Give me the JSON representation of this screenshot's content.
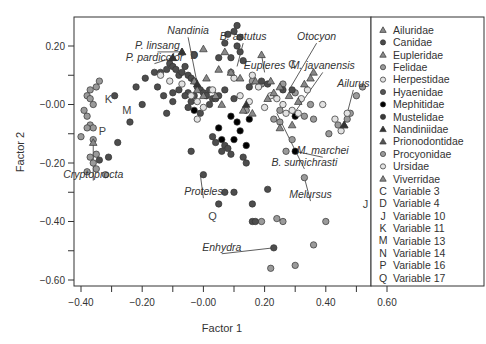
{
  "chart_data": {
    "type": "scatter",
    "title": "",
    "xlabel": "Factor 1",
    "ylabel": "Factor 2",
    "xlim": [
      -0.42,
      0.62
    ],
    "ylim": [
      -0.62,
      0.28
    ],
    "xticks": [
      -0.4,
      -0.3,
      -0.2,
      -0.1,
      0.0,
      0.1,
      0.2,
      0.3,
      0.4,
      0.5,
      0.6
    ],
    "xtick_labels": [
      "-0.40",
      "-0.20",
      "-0.00",
      "0.20",
      "0.40",
      "0.60"
    ],
    "yticks": [
      0.2,
      0.1,
      0.0,
      -0.1,
      -0.2,
      -0.3,
      -0.4,
      -0.5,
      -0.6
    ],
    "ytick_labels": [
      "0.20",
      "-0.00",
      "-0.20",
      "-0.40",
      "-0.60"
    ],
    "grid": false,
    "legend_position": "right",
    "legend": [
      {
        "label": "Ailuridae",
        "marker": "triangle",
        "color": "#8a8a8a"
      },
      {
        "label": "Canidae",
        "marker": "circle",
        "color": "#4a4a4a"
      },
      {
        "label": "Eupleridae",
        "marker": "triangle",
        "color": "#8a8a8a"
      },
      {
        "label": "Felidae",
        "marker": "circle",
        "color": "#9a9a9a"
      },
      {
        "label": "Herpestidae",
        "marker": "circle-open",
        "color": "#b8b8b8"
      },
      {
        "label": "Hyaenidae",
        "marker": "circle",
        "color": "#555555"
      },
      {
        "label": "Mephitidae",
        "marker": "circle",
        "color": "#000000"
      },
      {
        "label": "Mustelidae",
        "marker": "circle",
        "color": "#3a3a3a"
      },
      {
        "label": "Nandiniidae",
        "marker": "triangle",
        "color": "#333333"
      },
      {
        "label": "Prionodontidae",
        "marker": "triangle",
        "color": "#555555"
      },
      {
        "label": "Procyonidae",
        "marker": "circle",
        "color": "#9a9a9a"
      },
      {
        "label": "Ursidae",
        "marker": "circle-open",
        "color": "#b0b0b0"
      },
      {
        "label": "Viverridae",
        "marker": "triangle",
        "color": "#8a8a8a"
      },
      {
        "label": "Variable 3",
        "marker": "C"
      },
      {
        "label": "Variable 4",
        "marker": "D"
      },
      {
        "label": "Variable 10",
        "marker": "J"
      },
      {
        "label": "Variable 11",
        "marker": "K"
      },
      {
        "label": "Variable 13",
        "marker": "M"
      },
      {
        "label": "Variable 14",
        "marker": "N"
      },
      {
        "label": "Variable 16",
        "marker": "P"
      },
      {
        "label": "Variable 17",
        "marker": "Q"
      }
    ],
    "variable_labels": [
      {
        "letter": "C",
        "x": 0.29,
        "y": 0.14
      },
      {
        "letter": "D",
        "x": -0.03,
        "y": 0.17
      },
      {
        "letter": "J",
        "x": 0.53,
        "y": -0.34
      },
      {
        "letter": "K",
        "x": -0.31,
        "y": 0.02
      },
      {
        "letter": "M",
        "x": -0.25,
        "y": -0.02
      },
      {
        "letter": "P",
        "x": -0.33,
        "y": -0.09
      },
      {
        "letter": "Q",
        "x": 0.03,
        "y": -0.38
      }
    ],
    "annotations": [
      {
        "text": "Nandinia",
        "tx": -0.05,
        "ty": 0.24,
        "px": -0.02,
        "py": 0.07
      },
      {
        "text": "B. astutus",
        "tx": 0.13,
        "ty": 0.22,
        "px": 0.11,
        "py": 0.13
      },
      {
        "text": "P. linsang",
        "tx": -0.15,
        "ty": 0.19,
        "px": -0.07,
        "py": 0.18
      },
      {
        "text": "P. pardicolor",
        "tx": -0.16,
        "ty": 0.15,
        "px": -0.1,
        "py": 0.16
      },
      {
        "text": "Eupleres",
        "tx": 0.2,
        "ty": 0.12,
        "px": 0.19,
        "py": 0.17
      },
      {
        "text": "Otocyon",
        "tx": 0.37,
        "ty": 0.22,
        "px": 0.28,
        "py": 0.05
      },
      {
        "text": "M. javanensis",
        "tx": 0.39,
        "ty": 0.12,
        "px": 0.29,
        "py": -0.04
      },
      {
        "text": "Ailurus",
        "tx": 0.49,
        "ty": 0.06,
        "px": 0.46,
        "py": -0.07
      },
      {
        "text": "M. marchei",
        "tx": 0.39,
        "ty": -0.17,
        "px": 0.3,
        "py": -0.16
      },
      {
        "text": "B. sumichrasti",
        "tx": 0.33,
        "ty": -0.21,
        "px": 0.24,
        "py": -0.03
      },
      {
        "text": "Cryptoprocta",
        "tx": -0.36,
        "ty": -0.25,
        "px": -0.36,
        "py": -0.13
      },
      {
        "text": "Proteles",
        "tx": 0.0,
        "ty": -0.31,
        "px": -0.01,
        "py": -0.24
      },
      {
        "text": "Melursus",
        "tx": 0.35,
        "ty": -0.32,
        "px": 0.33,
        "py": -0.25
      },
      {
        "text": "Enhydra",
        "tx": 0.06,
        "ty": -0.5,
        "px": 0.23,
        "py": -0.49
      }
    ],
    "series": [
      {
        "name": "Felidae/Procyonidae (grey)",
        "marker": "circle",
        "color": "#9a9a9a",
        "points": [
          [
            -0.37,
            0.05
          ],
          [
            -0.35,
            0.06
          ],
          [
            -0.34,
            0.08
          ],
          [
            -0.38,
            0.03
          ],
          [
            -0.37,
            0.02
          ],
          [
            -0.36,
            0.0
          ],
          [
            -0.39,
            -0.02
          ],
          [
            -0.38,
            -0.04
          ],
          [
            -0.37,
            -0.07
          ],
          [
            -0.36,
            -0.08
          ],
          [
            -0.38,
            -0.08
          ],
          [
            -0.36,
            -0.12
          ],
          [
            -0.35,
            -0.17
          ],
          [
            -0.37,
            -0.18
          ],
          [
            -0.36,
            -0.2
          ],
          [
            -0.35,
            -0.22
          ],
          [
            -0.38,
            -0.23
          ],
          [
            -0.4,
            -0.11
          ],
          [
            -0.32,
            -0.24
          ],
          [
            0.09,
            0.11
          ],
          [
            0.16,
            0.08
          ],
          [
            0.19,
            0.07
          ],
          [
            0.26,
            0.07
          ],
          [
            0.3,
            0.04
          ],
          [
            0.35,
            0.0
          ],
          [
            0.33,
            -0.04
          ],
          [
            0.36,
            -0.05
          ],
          [
            0.25,
            -0.02
          ],
          [
            0.23,
            -0.05
          ],
          [
            0.25,
            -0.06
          ],
          [
            0.41,
            -0.1
          ],
          [
            0.44,
            -0.07
          ],
          [
            0.47,
            -0.05
          ],
          [
            0.48,
            -0.03
          ],
          [
            0.5,
            0.03
          ],
          [
            0.52,
            0.06
          ],
          [
            0.58,
            -0.08
          ],
          [
            0.58,
            -0.14
          ],
          [
            0.56,
            0.13
          ],
          [
            0.27,
            -0.16
          ],
          [
            0.33,
            -0.25
          ],
          [
            0.19,
            -0.4
          ],
          [
            0.24,
            -0.39
          ],
          [
            0.26,
            -0.4
          ],
          [
            0.4,
            -0.4
          ],
          [
            0.22,
            -0.56
          ],
          [
            0.3,
            -0.55
          ],
          [
            0.36,
            -0.48
          ],
          [
            0.29,
            -0.12
          ],
          [
            0.14,
            -0.02
          ]
        ]
      },
      {
        "name": "Canidae/Mustelidae/Hyaenidae (dark)",
        "marker": "circle",
        "color": "#4d4d4d",
        "points": [
          [
            -0.29,
            0.03
          ],
          [
            -0.22,
            0.06
          ],
          [
            -0.19,
            0.09
          ],
          [
            -0.16,
            0.11
          ],
          [
            -0.14,
            0.11
          ],
          [
            -0.12,
            0.12
          ],
          [
            -0.11,
            0.14
          ],
          [
            -0.1,
            0.13
          ],
          [
            -0.09,
            0.12
          ],
          [
            -0.08,
            0.1
          ],
          [
            -0.07,
            0.11
          ],
          [
            -0.06,
            0.13
          ],
          [
            -0.05,
            0.1
          ],
          [
            -0.04,
            0.09
          ],
          [
            -0.03,
            0.08
          ],
          [
            -0.02,
            0.06
          ],
          [
            -0.01,
            0.05
          ],
          [
            0.0,
            0.04
          ],
          [
            0.01,
            0.03
          ],
          [
            0.02,
            0.05
          ],
          [
            0.03,
            0.02
          ],
          [
            -0.05,
            0.04
          ],
          [
            -0.06,
            0.03
          ],
          [
            -0.04,
            0.01
          ],
          [
            -0.03,
            0.03
          ],
          [
            -0.08,
            0.05
          ],
          [
            -0.1,
            0.04
          ],
          [
            -0.13,
            0.03
          ],
          [
            -0.15,
            0.06
          ],
          [
            -0.2,
            0.0
          ],
          [
            -0.24,
            -0.06
          ],
          [
            -0.28,
            -0.13
          ],
          [
            -0.12,
            -0.03
          ],
          [
            -0.1,
            0.01
          ],
          [
            -0.05,
            -0.01
          ],
          [
            -0.01,
            -0.03
          ],
          [
            0.04,
            0.02
          ],
          [
            0.07,
            0.05
          ],
          [
            0.1,
            0.25
          ],
          [
            0.11,
            0.27
          ],
          [
            0.12,
            0.23
          ],
          [
            0.11,
            0.2
          ],
          [
            0.12,
            0.18
          ],
          [
            0.13,
            0.15
          ],
          [
            0.07,
            0.21
          ],
          [
            0.08,
            0.24
          ],
          [
            0.09,
            0.16
          ],
          [
            -0.03,
            0.17
          ],
          [
            0.05,
            0.16
          ],
          [
            0.19,
            0.08
          ],
          [
            0.21,
            0.07
          ],
          [
            0.26,
            0.05
          ],
          [
            0.29,
            0.05
          ],
          [
            0.15,
            0.06
          ],
          [
            0.02,
            0.0
          ],
          [
            0.05,
            0.03
          ],
          [
            0.1,
            0.02
          ],
          [
            0.03,
            -0.11
          ],
          [
            0.04,
            -0.13
          ],
          [
            0.07,
            -0.14
          ],
          [
            0.06,
            -0.16
          ],
          [
            0.08,
            -0.15
          ],
          [
            0.09,
            -0.17
          ],
          [
            -0.04,
            -0.16
          ],
          [
            0.13,
            -0.18
          ],
          [
            0.14,
            -0.2
          ],
          [
            0.0,
            -0.24
          ],
          [
            0.07,
            -0.3
          ],
          [
            0.1,
            -0.3
          ],
          [
            0.05,
            -0.34
          ],
          [
            0.16,
            -0.34
          ],
          [
            0.16,
            -0.4
          ],
          [
            0.17,
            -0.4
          ],
          [
            0.23,
            -0.49
          ],
          [
            -0.31,
            -0.18
          ],
          [
            -0.34,
            -0.19
          ],
          [
            0.21,
            -0.29
          ]
        ]
      },
      {
        "name": "Mephitidae (black)",
        "marker": "circle",
        "color": "#000000",
        "points": [
          [
            0.05,
            -0.08
          ],
          [
            0.09,
            -0.04
          ],
          [
            0.11,
            -0.06
          ],
          [
            0.12,
            -0.09
          ],
          [
            0.1,
            -0.12
          ],
          [
            0.14,
            -0.14
          ],
          [
            0.06,
            -0.12
          ],
          [
            0.15,
            -0.05
          ],
          [
            0.3,
            -0.16
          ],
          [
            0.3,
            -0.04
          ],
          [
            -0.03,
            -0.02
          ]
        ]
      },
      {
        "name": "Herpestidae/Ursidae (open)",
        "marker": "circle-open",
        "color": "#b5b5b5",
        "points": [
          [
            -0.14,
            0.1
          ],
          [
            -0.11,
            0.08
          ],
          [
            -0.07,
            0.07
          ],
          [
            -0.04,
            0.03
          ],
          [
            -0.02,
            0.01
          ],
          [
            0.0,
            -0.01
          ],
          [
            0.03,
            0.05
          ],
          [
            0.1,
            0.09
          ],
          [
            0.16,
            0.1
          ],
          [
            0.18,
            0.06
          ],
          [
            0.22,
            0.03
          ],
          [
            0.24,
            0.02
          ],
          [
            0.26,
            0.0
          ],
          [
            0.27,
            -0.03
          ],
          [
            0.29,
            -0.02
          ],
          [
            0.31,
            -0.03
          ],
          [
            0.32,
            0.02
          ],
          [
            0.34,
            0.05
          ],
          [
            0.39,
            0.0
          ],
          [
            0.43,
            -0.05
          ],
          [
            0.45,
            -0.09
          ],
          [
            0.47,
            -0.03
          ],
          [
            0.12,
            0.03
          ],
          [
            -0.02,
            -0.05
          ],
          [
            0.15,
            0.01
          ],
          [
            0.2,
            -0.01
          ]
        ]
      },
      {
        "name": "Viverridae/Eupleridae/Ailuridae (triangles)",
        "marker": "triangle",
        "color": "#888888",
        "points": [
          [
            0.19,
            0.17
          ],
          [
            0.07,
            0.18
          ],
          [
            0.0,
            0.19
          ],
          [
            -0.07,
            0.18
          ],
          [
            -0.1,
            0.16
          ],
          [
            0.05,
            0.12
          ],
          [
            0.09,
            0.11
          ],
          [
            0.12,
            0.09
          ],
          [
            0.17,
            0.08
          ],
          [
            0.22,
            0.08
          ],
          [
            0.25,
            0.06
          ],
          [
            0.28,
            0.03
          ],
          [
            0.31,
            0.01
          ],
          [
            0.25,
            -0.08
          ],
          [
            0.29,
            -0.07
          ],
          [
            0.36,
            0.11
          ],
          [
            0.35,
            0.09
          ],
          [
            0.46,
            -0.07
          ],
          [
            -0.02,
            0.05
          ],
          [
            0.0,
            0.03
          ],
          [
            0.04,
            0.03
          ],
          [
            0.06,
            0.0
          ],
          [
            0.13,
            -0.02
          ],
          [
            0.16,
            -0.03
          ],
          [
            0.21,
            0.02
          ],
          [
            0.23,
            0.04
          ],
          [
            0.33,
            0.07
          ],
          [
            0.01,
            0.09
          ],
          [
            -0.03,
            0.08
          ],
          [
            -0.36,
            -0.13
          ]
        ]
      },
      {
        "name": "Nandiniidae/Prionodontidae (dark triangles)",
        "marker": "triangle",
        "color": "#333333",
        "points": [
          [
            -0.07,
            0.18
          ],
          [
            -0.1,
            0.16
          ],
          [
            -0.02,
            0.07
          ],
          [
            0.14,
            0.0
          ],
          [
            0.46,
            -0.07
          ]
        ]
      }
    ]
  }
}
